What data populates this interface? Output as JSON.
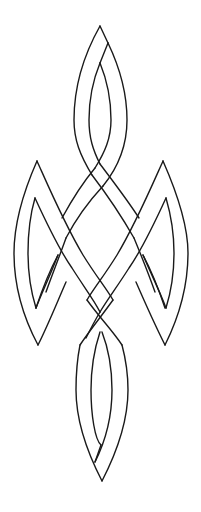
{
  "figure": {
    "background_color": "#ffffff",
    "line_color": "#1a1a1a"
  }
}
